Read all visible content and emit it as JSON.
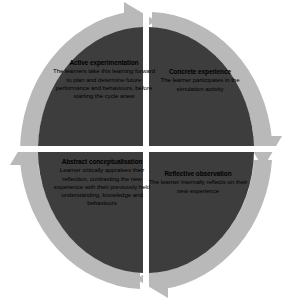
{
  "diagram": {
    "name": "Kolb experiential learning cycle",
    "direction": "clockwise",
    "colors": {
      "quadrant_fill": "#3d3d3d",
      "ring_arrow": "#b9b9b9",
      "ring_arrow_shadow": "#a3a3a3",
      "background": "#ffffff",
      "divider": "#ffffff",
      "text": "#000000"
    },
    "quadrants": [
      {
        "id": "concrete-experience",
        "position": "top-right",
        "title": "Concrete experience",
        "body": "The learner participates in the simulation activity"
      },
      {
        "id": "reflective-observation",
        "position": "bottom-right",
        "title": "Reflective observation",
        "body": "The learner internally reflects on their new experience"
      },
      {
        "id": "abstract-conceptualisation",
        "position": "bottom-left",
        "title": "Abstract conceptualisation",
        "body": "Learner critically appraises their reflection, contrasting the new experience with their previously held understanding, knowledge and behaviours"
      },
      {
        "id": "active-experimentation",
        "position": "top-left",
        "title": "Active experimentation",
        "body": "The learners take this learning forward to plan and determine future performance and behaviours, before starting the cycle anew"
      }
    ],
    "arrows": [
      {
        "id": "arrow-top",
        "points_to": "right",
        "label": "active-experimentation-to-concrete-experience"
      },
      {
        "id": "arrow-right",
        "points_to": "down",
        "label": "concrete-experience-to-reflective-observation"
      },
      {
        "id": "arrow-bottom",
        "points_to": "left",
        "label": "reflective-observation-to-abstract-conceptualisation"
      },
      {
        "id": "arrow-left",
        "points_to": "up",
        "label": "abstract-conceptualisation-to-active-experimentation"
      }
    ]
  }
}
